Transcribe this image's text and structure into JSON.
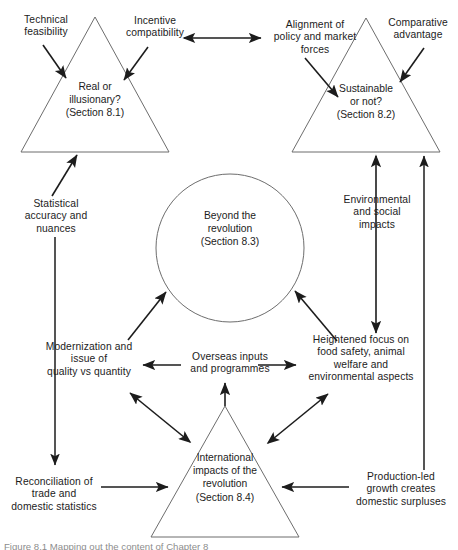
{
  "figure": {
    "caption": "Figure 8.1 Mapping out the content of Chapter 8",
    "background_color": "#ffffff",
    "line_color": "#4a4a4a",
    "text_color": "#1c1c1c"
  },
  "shapes": {
    "triangle_top_left": {
      "label": "Real or\nillusionary?\n(Section 8.1)",
      "shape": "triangle"
    },
    "triangle_top_right": {
      "label": "Sustainable\nor not?\n(Section 8.2)",
      "shape": "triangle"
    },
    "circle_center": {
      "label": "Beyond the\nrevolution\n(Section 8.3)",
      "shape": "circle"
    },
    "triangle_bottom": {
      "label": "International\nimpacts of the\nrevolution\n(Section 8.4)",
      "shape": "triangle"
    }
  },
  "labels": {
    "technical_feasibility": "Technical\nfeasibility",
    "incentive_compatibility": "Incentive\ncompatibility",
    "alignment_policy_market": "Alignment of\npolicy and market\nforces",
    "comparative_advantage": "Comparative\nadvantage",
    "statistical_accuracy": "Statistical\naccuracy and\nnuances",
    "environmental_social": "Environmental\nand social\nimpacts",
    "modernization_quality": "Modernization and\nissue of\nquality vs quantity",
    "overseas_inputs": "Overseas inputs\nand programmes",
    "heightened_focus": "Heightened focus on\nfood safety, animal\nwelfare and\nenvironmental aspects",
    "reconciliation_trade": "Reconciliation of\ntrade and\ndomestic statistics",
    "production_led_growth": "Production-led\ngrowth creates\ndomestic surpluses"
  }
}
